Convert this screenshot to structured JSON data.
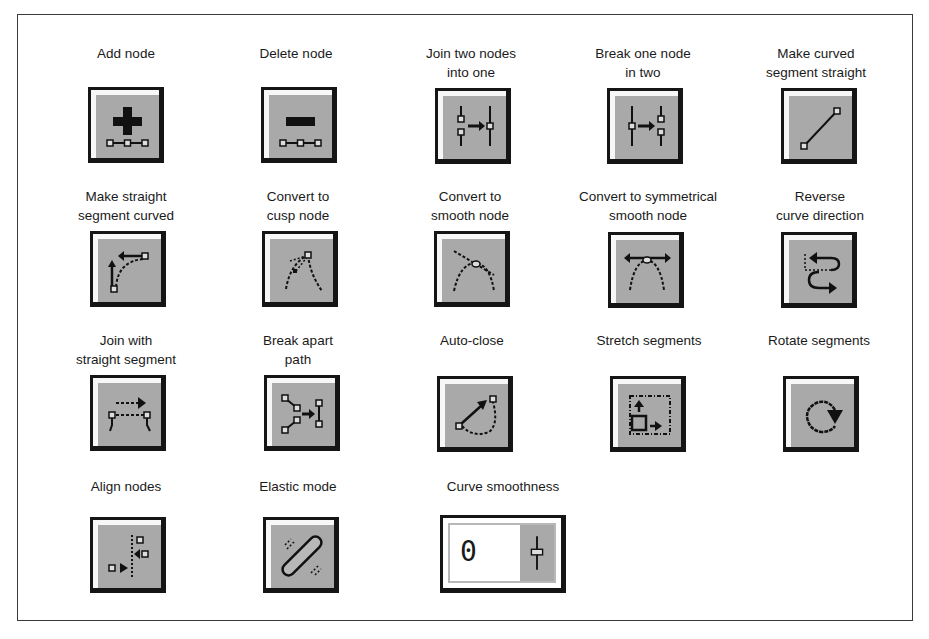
{
  "panel": {
    "colors": {
      "button_face": "#a9a9a9",
      "button_border": "#151515",
      "highlight": "#f7f7f7",
      "frame": "#3a3a3a"
    },
    "tools": [
      {
        "id": "add-node",
        "label_lines": [
          "Add node"
        ],
        "icon": "plus-with-nodes-icon"
      },
      {
        "id": "delete-node",
        "label_lines": [
          "Delete node"
        ],
        "icon": "minus-with-nodes-icon"
      },
      {
        "id": "join-two-nodes",
        "label_lines": [
          "Join two nodes",
          "into one"
        ],
        "icon": "join-nodes-icon"
      },
      {
        "id": "break-one-node",
        "label_lines": [
          "Break one node",
          "in two"
        ],
        "icon": "break-node-icon"
      },
      {
        "id": "make-curved-straight",
        "label_lines": [
          "Make curved",
          "segment straight"
        ],
        "icon": "straight-line-icon"
      },
      {
        "id": "make-straight-curved",
        "label_lines": [
          "Make straight",
          "segment curved"
        ],
        "icon": "curve-segment-icon"
      },
      {
        "id": "convert-cusp",
        "label_lines": [
          "Convert to",
          "cusp node"
        ],
        "icon": "cusp-node-icon"
      },
      {
        "id": "convert-smooth",
        "label_lines": [
          "Convert to",
          "smooth node"
        ],
        "icon": "smooth-node-icon"
      },
      {
        "id": "convert-symmetrical",
        "label_lines": [
          "Convert to symmetrical",
          "smooth node"
        ],
        "icon": "symmetrical-node-icon"
      },
      {
        "id": "reverse-direction",
        "label_lines": [
          "Reverse",
          "curve direction"
        ],
        "icon": "reverse-direction-icon"
      },
      {
        "id": "join-straight",
        "label_lines": [
          "Join with",
          "straight segment"
        ],
        "icon": "join-straight-icon"
      },
      {
        "id": "break-apart",
        "label_lines": [
          "Break apart",
          "path"
        ],
        "icon": "break-apart-icon"
      },
      {
        "id": "auto-close",
        "label_lines": [
          "Auto-close"
        ],
        "icon": "auto-close-icon"
      },
      {
        "id": "stretch-segments",
        "label_lines": [
          "Stretch segments"
        ],
        "icon": "stretch-icon"
      },
      {
        "id": "rotate-segments",
        "label_lines": [
          "Rotate segments"
        ],
        "icon": "rotate-icon"
      },
      {
        "id": "align-nodes",
        "label_lines": [
          "Align nodes"
        ],
        "icon": "align-nodes-icon"
      },
      {
        "id": "elastic-mode",
        "label_lines": [
          "Elastic mode"
        ],
        "icon": "elastic-icon"
      },
      {
        "id": "curve-smoothness",
        "label_lines": [
          "Curve smoothness"
        ],
        "icon": "slider-icon",
        "value": "0"
      }
    ]
  }
}
